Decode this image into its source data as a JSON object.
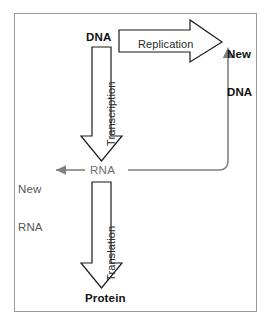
{
  "diagram": {
    "frame": {
      "stroke": "#9a9a9a"
    },
    "nodes": [
      {
        "id": "dna",
        "label": "DNA",
        "emphasis": "bold"
      },
      {
        "id": "rna",
        "label": "RNA",
        "emphasis": "muted"
      },
      {
        "id": "protein",
        "label": "Protein",
        "emphasis": "bold"
      },
      {
        "id": "new_dna",
        "label": "New\nDNA",
        "line1": "New",
        "line2": "DNA",
        "emphasis": "bold"
      },
      {
        "id": "new_rna",
        "label": "New\nRNA",
        "line1": "New",
        "line2": "RNA",
        "emphasis": "muted"
      }
    ],
    "edges": [
      {
        "id": "replication",
        "label": "Replication",
        "from": "dna",
        "to": "new_dna",
        "style": "block-arrow",
        "direction": "right"
      },
      {
        "id": "transcription",
        "label": "Transcription",
        "from": "dna",
        "to": "rna",
        "style": "block-arrow",
        "direction": "down"
      },
      {
        "id": "translation",
        "label": "Translation",
        "from": "rna",
        "to": "protein",
        "style": "block-arrow",
        "direction": "down"
      },
      {
        "id": "rna_to_new_rna",
        "label": "",
        "from": "rna",
        "to": "new_rna",
        "style": "line-arrow",
        "direction": "left"
      },
      {
        "id": "rna_to_new_dna",
        "label": "",
        "from": "rna",
        "to": "new_dna",
        "style": "line-arrow",
        "direction": "up"
      }
    ],
    "colors": {
      "outline": "#1a1a1a",
      "thin_line": "#808080",
      "frame": "#9a9a9a",
      "text_strong": "#111111",
      "text_muted": "#6e6e6e",
      "background": "#ffffff"
    }
  }
}
